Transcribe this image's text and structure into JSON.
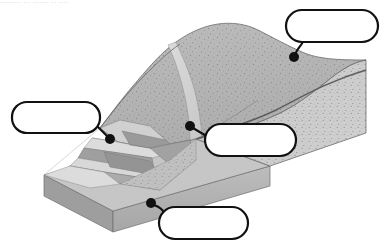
{
  "figure": {
    "kind": "geologic-block-diagram",
    "background_color": "#ffffff",
    "cropped_header_text": "......... ... ....... .. ....",
    "outline_color": "#111111"
  },
  "terrain": {
    "colors": {
      "hill_upper": "#b6b6b6",
      "hill_face_right": "#c9c9c9",
      "slip_band_light": "#d8d8d8",
      "terrace_light": "#d2d2d2",
      "terrace_mid": "#bdbdbd",
      "terrace_dark": "#9e9e9e",
      "toe_light": "#d9d9d9",
      "base_top": "#c4c4c4",
      "base_front": "#b0b0b0",
      "base_side": "#9a9a9a",
      "speckle": "#6b6b6b",
      "line": "#5a5a5a"
    },
    "features": [
      {
        "name": "crown-scarp",
        "description": "upper curved break in slope along hill crest"
      },
      {
        "name": "rupture-surface",
        "description": "curved concave slip surface exposed on right cut face"
      },
      {
        "name": "slump-blocks",
        "description": "stepped back-rotated terraces on left slope"
      },
      {
        "name": "toe",
        "description": "bulged lobe at base of slope"
      },
      {
        "name": "base-block",
        "description": "rectangular cut-away ground block beneath"
      }
    ]
  },
  "callouts": [
    {
      "id": "callout-1",
      "label": "",
      "box": {
        "x": 286,
        "y": 10,
        "w": 92,
        "h": 32,
        "rx": 16
      },
      "dot": {
        "x": 294,
        "y": 57,
        "r": 5
      },
      "leader": "M 303 42 C 299 48 296 51 295 55"
    },
    {
      "id": "callout-2",
      "label": "",
      "box": {
        "x": 12,
        "y": 102,
        "w": 88,
        "h": 31,
        "rx": 15
      },
      "dot": {
        "x": 110,
        "y": 139,
        "r": 5
      },
      "leader": "M 96 125 L 108 137"
    },
    {
      "id": "callout-3",
      "label": "",
      "box": {
        "x": 205,
        "y": 124,
        "w": 91,
        "h": 32,
        "rx": 16
      },
      "dot": {
        "x": 190,
        "y": 126,
        "r": 5
      },
      "leader": "M 193 128 L 208 137"
    },
    {
      "id": "callout-4",
      "label": "",
      "box": {
        "x": 159,
        "y": 207,
        "w": 89,
        "h": 32,
        "rx": 16
      },
      "dot": {
        "x": 151,
        "y": 203,
        "r": 5
      },
      "leader": "M 154 205 C 160 207 163 210 165 214"
    }
  ]
}
